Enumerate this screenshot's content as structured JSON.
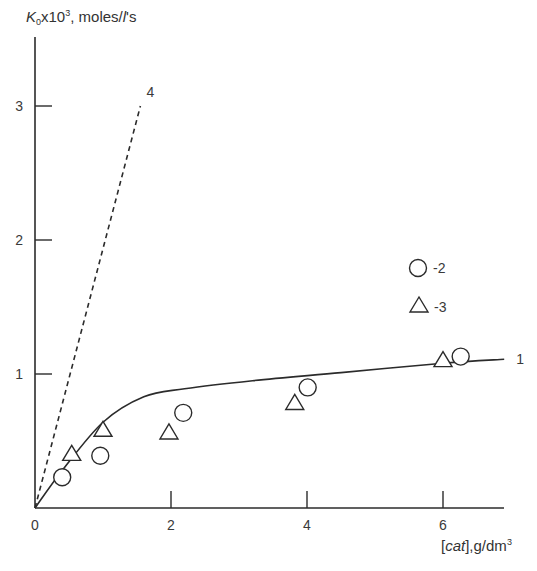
{
  "chart_data": {
    "type": "scatter",
    "title": "",
    "xlabel": "[cat],g/dm³",
    "ylabel": "K₀x10³, moles/l's",
    "ylabel_parts": {
      "k": "K",
      "sub": "0",
      "mid": "x10",
      "sup": "3",
      "rest1": ", moles/",
      "l": "l",
      "rest2": "'s"
    },
    "xlabel_parts": {
      "open": "[",
      "cat": "cat",
      "close": "],g/dm",
      "sup": "3"
    },
    "xlim": [
      0,
      7
    ],
    "ylim": [
      0,
      3.5
    ],
    "x_ticks": [
      0,
      2,
      4,
      6
    ],
    "x_tick_labels": [
      "0",
      "2",
      "4",
      "6"
    ],
    "y_ticks": [
      1,
      2,
      3
    ],
    "y_tick_labels": [
      "1",
      "2",
      "3"
    ],
    "grid": false,
    "legend_position": "right-middle",
    "legend": [
      {
        "marker": "circle",
        "label": "-2"
      },
      {
        "marker": "triangle",
        "label": "-3"
      }
    ],
    "series": [
      {
        "name": "1",
        "style": "solid-line",
        "label": "1",
        "x": [
          0,
          0.4,
          1.0,
          1.6,
          2.2,
          3.2,
          4.5,
          6.0,
          6.9
        ],
        "y": [
          0,
          0.28,
          0.64,
          0.83,
          0.89,
          0.95,
          1.01,
          1.08,
          1.11
        ]
      },
      {
        "name": "4",
        "style": "dashed-line",
        "label": "4",
        "x": [
          0,
          1.55
        ],
        "y": [
          0,
          3.0
        ]
      },
      {
        "name": "2",
        "style": "circle-markers",
        "x": [
          0.4,
          0.96,
          2.18,
          4.01,
          6.26
        ],
        "y": [
          0.23,
          0.39,
          0.71,
          0.9,
          1.13
        ]
      },
      {
        "name": "3",
        "style": "triangle-markers",
        "x": [
          0.54,
          1.0,
          1.97,
          3.82,
          6.0
        ],
        "y": [
          0.4,
          0.58,
          0.56,
          0.78,
          1.1
        ]
      }
    ]
  }
}
